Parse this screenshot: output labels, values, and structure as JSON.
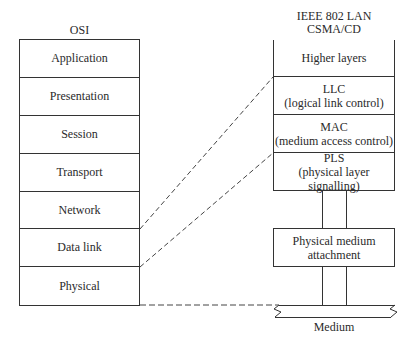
{
  "osi": {
    "title": "OSI",
    "layers": [
      "Application",
      "Presentation",
      "Session",
      "Transport",
      "Network",
      "Data link",
      "Physical"
    ]
  },
  "ieee": {
    "title_line1": "IEEE 802 LAN",
    "title_line2": "CSMA/CD",
    "higher_layers": "Higher layers",
    "llc": {
      "name": "LLC",
      "desc": "(logical link control)"
    },
    "mac": {
      "name": "MAC",
      "desc": "(medium access control)"
    },
    "pls": {
      "name": "PLS",
      "desc": "(physical layer signalling)"
    },
    "pma": {
      "line1": "Physical medium",
      "line2": "attachment"
    },
    "medium": "Medium"
  },
  "colors": {
    "line": "#333333",
    "dash": "#444444"
  }
}
